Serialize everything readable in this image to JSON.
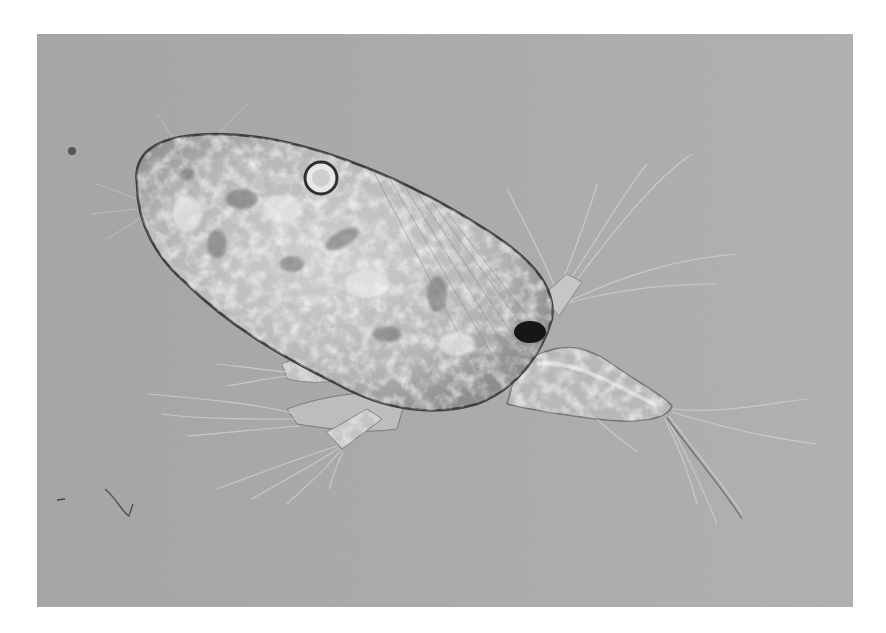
{
  "image": {
    "subject": "micrograph of a crustacean larva (nauplius/copepodid) with setae",
    "kind": "grayscale light micrograph",
    "colors": {
      "border": "#ffffff",
      "background_left": "#a6a6a6",
      "background_right": "#afafaf",
      "body_mid": "#b9b9b9",
      "body_highlight": "#e6e6e6",
      "body_shadow": "#5a5a5a",
      "dark_spot": "#141414",
      "setae": "#d2d2d2"
    }
  }
}
